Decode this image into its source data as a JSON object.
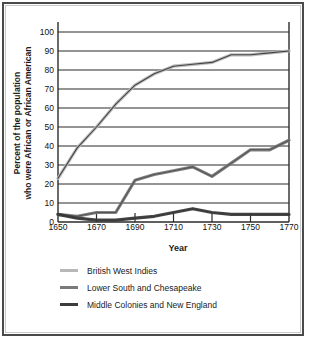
{
  "chart_data": {
    "type": "line",
    "title": "",
    "xlabel": "Year",
    "ylabel": "Percent of the population who were African or African American",
    "ylabel_line1": "Percent of the population",
    "ylabel_line2": "who were African or African American",
    "xlim": [
      1650,
      1770
    ],
    "ylim": [
      0,
      100
    ],
    "grid": true,
    "legend_position": "bottom-left",
    "yticks": [
      100,
      90,
      80,
      70,
      60,
      50,
      40,
      30,
      20,
      10,
      0
    ],
    "xticks": [
      1650,
      1670,
      1690,
      1710,
      1730,
      1750,
      1770
    ],
    "x": [
      1650,
      1660,
      1670,
      1680,
      1690,
      1700,
      1710,
      1720,
      1730,
      1740,
      1750,
      1760,
      1770
    ],
    "series": [
      {
        "name": "British West Indies",
        "color": "#b8b8b8",
        "values": [
          23,
          39,
          50,
          62,
          72,
          78,
          82,
          83,
          84,
          88,
          88,
          89,
          90
        ]
      },
      {
        "name": "Lower South and Chesapeake",
        "color": "#7a7a7a",
        "values": [
          4,
          3,
          5,
          5,
          22,
          25,
          27,
          29,
          24,
          31,
          38,
          38,
          43
        ]
      },
      {
        "name": "Middle Colonies and New England",
        "color": "#3c3c3c",
        "values": [
          4,
          2,
          1,
          1,
          2,
          3,
          5,
          7,
          5,
          4,
          4,
          4,
          4
        ]
      }
    ]
  },
  "legend": {
    "items": [
      {
        "label": "British West Indies",
        "color": "#b8b8b8"
      },
      {
        "label": "Lower South and Chesapeake",
        "color": "#7a7a7a"
      },
      {
        "label": "Middle Colonies and New England",
        "color": "#3c3c3c"
      }
    ]
  }
}
